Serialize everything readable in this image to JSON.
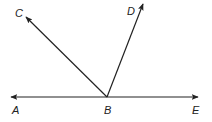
{
  "diagram": {
    "type": "geometry-angles",
    "colors": {
      "stroke": "#222222",
      "background": "#ffffff"
    },
    "points": {
      "A": {
        "label": "A",
        "x": 11,
        "y": 97
      },
      "B": {
        "label": "B",
        "x": 107,
        "y": 97
      },
      "C": {
        "label": "C",
        "x": 26,
        "y": 17
      },
      "D": {
        "label": "D",
        "x": 143,
        "y": 4
      },
      "E": {
        "label": "E",
        "x": 198,
        "y": 97
      }
    },
    "rays": [
      {
        "name": "ray-BA",
        "from": "B",
        "to": "A"
      },
      {
        "name": "ray-BC",
        "from": "B",
        "to": "C"
      },
      {
        "name": "ray-BD",
        "from": "B",
        "to": "D"
      },
      {
        "name": "ray-BE",
        "from": "B",
        "to": "E"
      }
    ],
    "labels": [
      {
        "name": "label-C",
        "text": "C",
        "x": 15,
        "y": 17
      },
      {
        "name": "label-D",
        "text": "D",
        "x": 127,
        "y": 15
      },
      {
        "name": "label-A",
        "text": "A",
        "x": 12,
        "y": 114
      },
      {
        "name": "label-B",
        "text": "B",
        "x": 104,
        "y": 114
      },
      {
        "name": "label-E",
        "text": "E",
        "x": 192,
        "y": 114
      }
    ]
  }
}
